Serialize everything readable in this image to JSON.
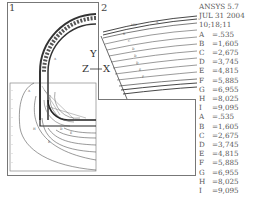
{
  "app": {
    "name": "ANSYS 5.7"
  },
  "header": {
    "line1": "ANSYS  5.7",
    "line2": "JUL  31  2004",
    "line3": "10;18;11"
  },
  "windows": [
    {
      "id": "1",
      "label": "1"
    },
    {
      "id": "2",
      "label": "2"
    }
  ],
  "triad": {
    "y": "Y",
    "z": "Z",
    "x": "X",
    "dash": "—"
  },
  "legend": {
    "set1": [
      {
        "key": "A",
        "value": "=.535"
      },
      {
        "key": "B",
        "value": "=1,605"
      },
      {
        "key": "C",
        "value": "=2,675"
      },
      {
        "key": "D",
        "value": "=3,745"
      },
      {
        "key": "E",
        "value": "=4,815"
      },
      {
        "key": "F",
        "value": "=5,885"
      },
      {
        "key": "G",
        "value": "=6,955"
      },
      {
        "key": "H",
        "value": "=8,025"
      },
      {
        "key": "I",
        "value": "=9,095"
      }
    ],
    "set2": [
      {
        "key": "A",
        "value": "=.535"
      },
      {
        "key": "B",
        "value": "=1,605"
      },
      {
        "key": "C",
        "value": "=2,675"
      },
      {
        "key": "D",
        "value": "=3,745"
      },
      {
        "key": "E",
        "value": "=4,815"
      },
      {
        "key": "F",
        "value": "=5,885"
      },
      {
        "key": "G",
        "value": "=6,955"
      },
      {
        "key": "H",
        "value": "=8,025"
      },
      {
        "key": "I",
        "value": "=9,095"
      }
    ]
  }
}
